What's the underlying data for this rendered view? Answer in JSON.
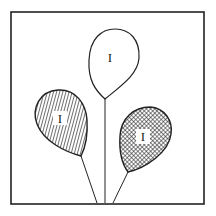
{
  "figure": {
    "frame_color": "#222222",
    "background": "#ffffff",
    "balloons": [
      {
        "id": "top",
        "label": "I",
        "fill": "plain"
      },
      {
        "id": "left",
        "label": "I",
        "fill": "diagonal-hatch"
      },
      {
        "id": "right",
        "label": "I",
        "fill": "cross-hatch"
      }
    ]
  }
}
